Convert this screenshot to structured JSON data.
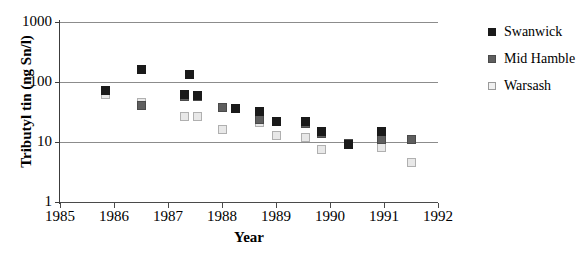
{
  "chart_data": {
    "type": "scatter",
    "title": "",
    "xlabel": "Year",
    "ylabel": "Tributyl tin (ng Sn/l)",
    "xlim": [
      1985,
      1992
    ],
    "ylim": [
      1,
      1000
    ],
    "yscale": "log",
    "grid": true,
    "legend_position": "right",
    "xticks": [
      1985,
      1986,
      1987,
      1988,
      1989,
      1990,
      1991,
      1992
    ],
    "xtick_labels": [
      "1985",
      "1986",
      "1987",
      "1988",
      "1989",
      "1990",
      "1991",
      "1992"
    ],
    "yticks": [
      1,
      10,
      100,
      1000
    ],
    "ytick_labels": [
      "1",
      "10",
      "100",
      "1000"
    ],
    "series": [
      {
        "name": "Swanwick",
        "color": "#1a1a1a",
        "marker": "filled-square",
        "points": [
          {
            "x": 1985.85,
            "y": 72
          },
          {
            "x": 1986.5,
            "y": 160
          },
          {
            "x": 1987.4,
            "y": 135
          },
          {
            "x": 1987.3,
            "y": 62
          },
          {
            "x": 1987.55,
            "y": 60
          },
          {
            "x": 1988.25,
            "y": 36
          },
          {
            "x": 1988.7,
            "y": 32
          },
          {
            "x": 1989.0,
            "y": 22
          },
          {
            "x": 1989.55,
            "y": 22
          },
          {
            "x": 1989.85,
            "y": 15
          },
          {
            "x": 1990.35,
            "y": 9
          },
          {
            "x": 1990.95,
            "y": 15
          }
        ]
      },
      {
        "name": "Mid Hamble",
        "color": "#5e5e5e",
        "marker": "gray-square",
        "points": [
          {
            "x": 1986.5,
            "y": 40
          },
          {
            "x": 1987.3,
            "y": 58
          },
          {
            "x": 1987.55,
            "y": 58
          },
          {
            "x": 1988.0,
            "y": 38
          },
          {
            "x": 1988.7,
            "y": 24
          },
          {
            "x": 1989.55,
            "y": 20
          },
          {
            "x": 1989.85,
            "y": 14
          },
          {
            "x": 1990.35,
            "y": 9.5
          },
          {
            "x": 1990.95,
            "y": 11
          },
          {
            "x": 1991.5,
            "y": 11
          }
        ]
      },
      {
        "name": "Warsash",
        "color": "#e8e8e8",
        "marker": "open-square",
        "points": [
          {
            "x": 1985.85,
            "y": 62
          },
          {
            "x": 1986.5,
            "y": 46
          },
          {
            "x": 1987.3,
            "y": 27
          },
          {
            "x": 1987.55,
            "y": 27
          },
          {
            "x": 1988.0,
            "y": 16
          },
          {
            "x": 1988.7,
            "y": 21
          },
          {
            "x": 1989.0,
            "y": 13
          },
          {
            "x": 1989.55,
            "y": 12
          },
          {
            "x": 1989.85,
            "y": 7.5
          },
          {
            "x": 1990.35,
            "y": 9
          },
          {
            "x": 1990.95,
            "y": 8
          },
          {
            "x": 1991.5,
            "y": 4.5
          }
        ]
      }
    ]
  },
  "legend": {
    "items": [
      {
        "label": "Swanwick",
        "swatch_class": "swanwick"
      },
      {
        "label": "Mid Hamble",
        "swatch_class": "midhamble"
      },
      {
        "label": "Warsash",
        "swatch_class": "warsash"
      }
    ]
  }
}
